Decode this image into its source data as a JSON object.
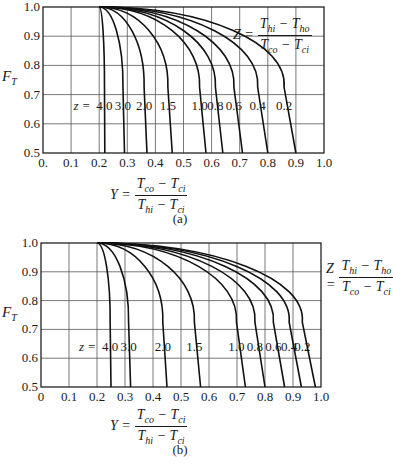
{
  "chart_data": [
    {
      "id": "a",
      "type": "line",
      "caption": "(a)",
      "title": "",
      "xlabel": "Y = (T_co - T_ci) / (T_hi - T_ci)",
      "ylabel": "F_T",
      "xlim": [
        0,
        1.0
      ],
      "ylim": [
        0.5,
        1.0
      ],
      "grid": true,
      "x_ticks": [
        "0.",
        "0.1",
        "0.2",
        "0.3",
        "0.4",
        "0.5",
        "0.6",
        "0.7",
        "0.8",
        "0.9",
        "1.0"
      ],
      "y_ticks": [
        "0.5",
        "0.6",
        "0.7",
        "0.8",
        "0.9",
        "1.0"
      ],
      "annotation": "Z = (T_hi - T_ho) / (T_co - T_ci)",
      "curve_label_prefix": "z =",
      "series": [
        {
          "name": "4.0",
          "start": [
            0.2,
            1.0
          ],
          "x_at_ft_0_5": 0.22
        },
        {
          "name": "3.0",
          "start": [
            0.2,
            1.0
          ],
          "x_at_ft_0_5": 0.29
        },
        {
          "name": "2.0",
          "start": [
            0.2,
            1.0
          ],
          "x_at_ft_0_5": 0.37
        },
        {
          "name": "1.5",
          "start": [
            0.2,
            1.0
          ],
          "x_at_ft_0_5": 0.46
        },
        {
          "name": "1.0",
          "start": [
            0.2,
            1.0
          ],
          "x_at_ft_0_5": 0.58
        },
        {
          "name": "0.8",
          "start": [
            0.2,
            1.0
          ],
          "x_at_ft_0_5": 0.64
        },
        {
          "name": "0.6",
          "start": [
            0.2,
            1.0
          ],
          "x_at_ft_0_5": 0.71
        },
        {
          "name": "0.4",
          "start": [
            0.2,
            1.0
          ],
          "x_at_ft_0_5": 0.8
        },
        {
          "name": "0.2",
          "start": [
            0.2,
            1.0
          ],
          "x_at_ft_0_5": 0.9
        }
      ]
    },
    {
      "id": "b",
      "type": "line",
      "caption": "(b)",
      "title": "",
      "xlabel": "Y = (T_co - T_ci) / (T_hi - T_ci)",
      "ylabel": "F_T",
      "xlim": [
        0,
        1.0
      ],
      "ylim": [
        0.5,
        1.0
      ],
      "grid": true,
      "x_ticks": [
        "0",
        "0.1",
        "0.2",
        "0.3",
        "0.4",
        "0.5",
        "0.6",
        "0.7",
        "0.8",
        "0.9",
        "1.0"
      ],
      "y_ticks": [
        "0.5",
        "0.6",
        "0.7",
        "0.8",
        "0.9",
        "1.0"
      ],
      "annotation": "Z = (T_hi - T_ho) / (T_co - T_ci)",
      "curve_label_prefix": "z =",
      "series": [
        {
          "name": "4.0",
          "start": [
            0.2,
            1.0
          ],
          "x_at_ft_0_5": 0.25
        },
        {
          "name": "3.0",
          "start": [
            0.2,
            1.0
          ],
          "x_at_ft_0_5": 0.32
        },
        {
          "name": "2.0",
          "start": [
            0.2,
            1.0
          ],
          "x_at_ft_0_5": 0.45
        },
        {
          "name": "1.5",
          "start": [
            0.2,
            1.0
          ],
          "x_at_ft_0_5": 0.57
        },
        {
          "name": "1.0",
          "start": [
            0.2,
            1.0
          ],
          "x_at_ft_0_5": 0.73
        },
        {
          "name": "0.8",
          "start": [
            0.2,
            1.0
          ],
          "x_at_ft_0_5": 0.8
        },
        {
          "name": "0.6",
          "start": [
            0.2,
            1.0
          ],
          "x_at_ft_0_5": 0.87
        },
        {
          "name": "0.4",
          "start": [
            0.2,
            1.0
          ],
          "x_at_ft_0_5": 0.93
        },
        {
          "name": "0.2",
          "start": [
            0.2,
            1.0
          ],
          "x_at_ft_0_5": 0.98
        }
      ]
    }
  ],
  "labels": {
    "ylabel_main": "F",
    "ylabel_sub": "T",
    "z_formula": {
      "lhs": "Z =",
      "num_a": "T",
      "num_a_sub": "hi",
      "num_op": " − ",
      "num_b": "T",
      "num_b_sub": "ho",
      "den_a": "T",
      "den_a_sub": "co",
      "den_op": " − ",
      "den_b": "T",
      "den_b_sub": "ci"
    },
    "y_formula": {
      "lhs": "Y =",
      "num_a": "T",
      "num_a_sub": "co",
      "num_op": " − ",
      "num_b": "T",
      "num_b_sub": "ci",
      "den_a": "T",
      "den_a_sub": "hi",
      "den_op": " − ",
      "den_b": "T",
      "den_b_sub": "ci"
    }
  }
}
